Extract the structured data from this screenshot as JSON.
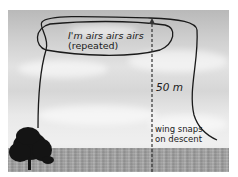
{
  "figure": {
    "type": "annotated-photo",
    "scene": "open grassland with a lone tree under a cloudy sky",
    "annotations": {
      "loop_label_line1": "I'm airs airs airs",
      "loop_label_line2": "(repeated)",
      "height_label": "50 m",
      "descent_label_line1": "wing snaps",
      "descent_label_line2": "on descent"
    },
    "elements": {
      "flight_path": "curved line rising from tree, looping at top, descending on right",
      "height_marker": "dashed vertical arrow from ground to top of loop"
    },
    "colors": {
      "line": "#1a1a1a",
      "sky": "#d9d9d9",
      "ground": "#a0a0a0",
      "tree": "#141414"
    }
  }
}
